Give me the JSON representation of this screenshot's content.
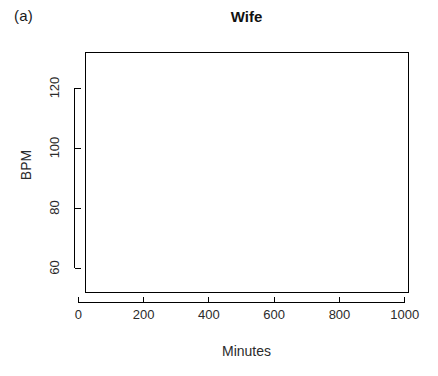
{
  "figure": {
    "panel_label": "(a)",
    "width": 438,
    "height": 376,
    "background": "#ffffff",
    "line_color": "#000000"
  },
  "chart_data": {
    "type": "line",
    "title": "Wife",
    "xlabel": "Minutes",
    "ylabel": "BPM",
    "xlim": [
      20,
      1010
    ],
    "ylim": [
      52,
      132
    ],
    "xticks": [
      0,
      200,
      400,
      600,
      800,
      1000
    ],
    "xtick_labels": [
      "0",
      "200",
      "400",
      "600",
      "800",
      "1000"
    ],
    "yticks": [
      60,
      80,
      100,
      120
    ],
    "ytick_labels": [
      "60",
      "80",
      "100",
      "120"
    ],
    "grid": false,
    "legend": false,
    "legend_position": "none",
    "x_start": 40,
    "x_end": 980,
    "n_points": 470,
    "series": [
      {
        "name": "Wife BPM",
        "color": "#000000",
        "line_width": 0.9,
        "y_min": 68,
        "y_max": 123,
        "y_mean": 92,
        "x_sampling_minutes": 2,
        "segments": [
          {
            "x_from": 40,
            "x_to": 70,
            "baseline": 88,
            "amplitude": 6,
            "note": "rising start near 83-95"
          },
          {
            "x_from": 70,
            "x_to": 100,
            "baseline": 94,
            "amplitude": 7,
            "note": "spike to 110 at ~62"
          },
          {
            "x_from": 100,
            "x_to": 130,
            "baseline": 95,
            "amplitude": 8,
            "note": "tall spike to 121 at ~110"
          },
          {
            "x_from": 130,
            "x_to": 175,
            "baseline": 90,
            "amplitude": 7,
            "note": "spike to 105 at ~130 and ~175"
          },
          {
            "x_from": 175,
            "x_to": 215,
            "baseline": 83,
            "amplitude": 7,
            "note": "dip to 77"
          },
          {
            "x_from": 215,
            "x_to": 270,
            "baseline": 88,
            "amplitude": 7,
            "note": "choppy 81-97"
          },
          {
            "x_from": 270,
            "x_to": 300,
            "baseline": 84,
            "amplitude": 9,
            "note": "dip to 75, spike to 104 at ~285"
          },
          {
            "x_from": 300,
            "x_to": 360,
            "baseline": 90,
            "amplitude": 7,
            "note": "rising to 99"
          },
          {
            "x_from": 360,
            "x_to": 440,
            "baseline": 98,
            "amplitude": 7,
            "note": "plateau near 100-108"
          },
          {
            "x_from": 440,
            "x_to": 460,
            "baseline": 96,
            "amplitude": 11,
            "note": "spike to 115 then dip to 82"
          },
          {
            "x_from": 460,
            "x_to": 520,
            "baseline": 99,
            "amplitude": 7,
            "note": "plateau 95-109"
          },
          {
            "x_from": 520,
            "x_to": 560,
            "baseline": 95,
            "amplitude": 7,
            "note": "descending"
          },
          {
            "x_from": 560,
            "x_to": 620,
            "baseline": 90,
            "amplitude": 5,
            "note": "steady near 88-96"
          },
          {
            "x_from": 620,
            "x_to": 660,
            "baseline": 92,
            "amplitude": 6,
            "note": "dip to 80 at ~650"
          },
          {
            "x_from": 660,
            "x_to": 710,
            "baseline": 95,
            "amplitude": 5,
            "note": "near 93-101"
          },
          {
            "x_from": 710,
            "x_to": 770,
            "baseline": 89,
            "amplitude": 5,
            "note": "drop to 86-91"
          },
          {
            "x_from": 770,
            "x_to": 810,
            "baseline": 97,
            "amplitude": 9,
            "note": "rising, spike to 120 at ~803"
          },
          {
            "x_from": 810,
            "x_to": 845,
            "baseline": 96,
            "amplitude": 10,
            "note": "spike to 115 at ~828, dip to 82"
          },
          {
            "x_from": 845,
            "x_to": 890,
            "baseline": 99,
            "amplitude": 8,
            "note": "peaks near 110 and 105"
          },
          {
            "x_from": 890,
            "x_to": 915,
            "baseline": 90,
            "amplitude": 14,
            "note": "spike to 123 at ~905, dip to 79"
          },
          {
            "x_from": 915,
            "x_to": 950,
            "baseline": 86,
            "amplitude": 9,
            "note": "choppy 79-95, spike 117 at ~940"
          },
          {
            "x_from": 950,
            "x_to": 980,
            "baseline": 85,
            "amplitude": 10,
            "note": "final dip to 68 then back to 90"
          }
        ]
      }
    ]
  },
  "plot_box": {
    "left": 85,
    "top": 52,
    "right": 408,
    "bottom": 292,
    "border_color": "#000000",
    "border_width": 1
  }
}
